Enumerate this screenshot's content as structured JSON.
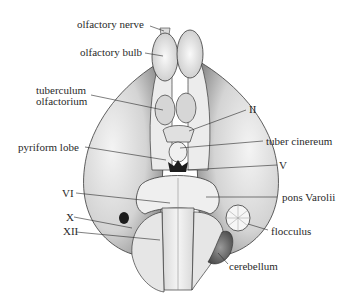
{
  "figure": {
    "colors": {
      "ink": "#2a2a2a",
      "shade_light": "#e8e8e8",
      "shade_mid": "#bdbdbd",
      "shade_dark": "#555555",
      "background": "#ffffff"
    }
  },
  "labels": [
    {
      "id": "olfactory-nerve",
      "text": "olfactory nerve"
    },
    {
      "id": "olfactory-bulb",
      "text": "olfactory bulb"
    },
    {
      "id": "tuberculum-olfactorium",
      "text": "tuberculum\nolfactorium"
    },
    {
      "id": "optic-nerve-II",
      "text": "II"
    },
    {
      "id": "tuber-cinereum",
      "text": "tuber cinereum"
    },
    {
      "id": "pyriform-lobe",
      "text": "pyriform lobe"
    },
    {
      "id": "trigeminal-V",
      "text": "V"
    },
    {
      "id": "abducens-VI",
      "text": "VI"
    },
    {
      "id": "pons-varolii",
      "text": "pons Varolii"
    },
    {
      "id": "vagus-X",
      "text": "X"
    },
    {
      "id": "hypoglossal-XII",
      "text": "XII"
    },
    {
      "id": "flocculus",
      "text": "flocculus"
    },
    {
      "id": "cerebellum",
      "text": "cerebellum"
    }
  ]
}
